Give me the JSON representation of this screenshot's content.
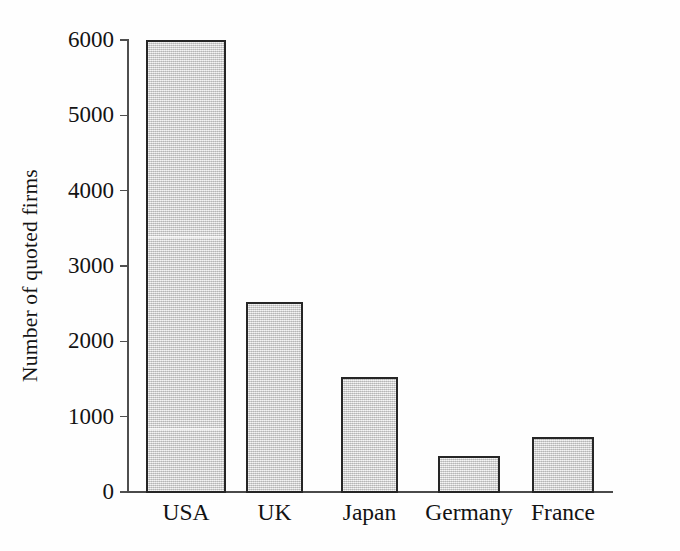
{
  "chart_data": {
    "type": "bar",
    "title": "",
    "xlabel": "",
    "ylabel": "Number of quoted firms",
    "categories": [
      "USA",
      "UK",
      "Japan",
      "Germany",
      "France"
    ],
    "values": [
      6000,
      2520,
      1520,
      480,
      730
    ],
    "ylim": [
      0,
      6000
    ],
    "yticks": [
      0,
      1000,
      2000,
      3000,
      4000,
      5000,
      6000
    ],
    "ytick_labels": [
      "0",
      "1000",
      "2000",
      "3000",
      "4000",
      "5000",
      "6000"
    ],
    "grid": false,
    "legend": null,
    "bar_fill_color": "#d2d2d2",
    "bar_border_color": "#262626",
    "background_color": "#fefefe",
    "axis_color": "#4f4f4f"
  },
  "axis": {
    "y_title": "Number of quoted firms"
  }
}
